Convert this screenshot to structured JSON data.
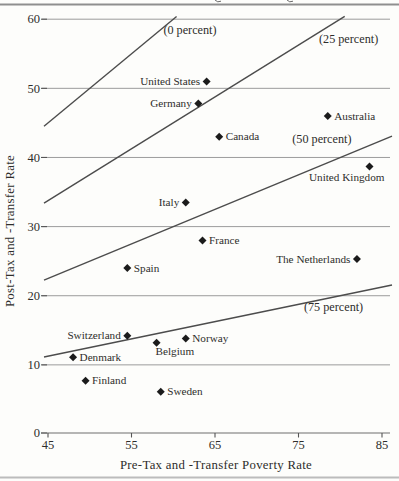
{
  "page": {
    "top_rule": {
      "visible": true,
      "descender_fragments_x": [
        218,
        290
      ]
    },
    "bottom_rule": {
      "visible": true
    }
  },
  "chart_data": {
    "type": "scatter",
    "title": "",
    "xlabel": "Pre-Tax and -Transfer Poverty Rate",
    "ylabel": "Post-Tax and -Transfer Rate",
    "xlim": [
      45,
      85
    ],
    "ylim": [
      0,
      60
    ],
    "x_ticks": [
      45,
      55,
      65,
      75,
      85
    ],
    "y_ticks": [
      0,
      10,
      20,
      30,
      40,
      50,
      60
    ],
    "grid": "horizontal-only",
    "marker": "diamond",
    "legend_position": "none",
    "points": [
      {
        "label": "United States",
        "x": 64,
        "y": 51,
        "label_side": "left"
      },
      {
        "label": "Germany",
        "x": 63,
        "y": 47.8,
        "label_side": "left"
      },
      {
        "label": "Australia",
        "x": 78.5,
        "y": 46,
        "label_side": "right"
      },
      {
        "label": "Canada",
        "x": 65.5,
        "y": 43,
        "label_side": "right"
      },
      {
        "label": "United Kingdom",
        "x": 83.5,
        "y": 38.7,
        "label_side": "below-left"
      },
      {
        "label": "Italy",
        "x": 61.5,
        "y": 33.5,
        "label_side": "left"
      },
      {
        "label": "France",
        "x": 63.5,
        "y": 28,
        "label_side": "right"
      },
      {
        "label": "The Netherlands",
        "x": 82,
        "y": 25.3,
        "label_side": "left"
      },
      {
        "label": "Spain",
        "x": 54.5,
        "y": 24,
        "label_side": "right"
      },
      {
        "label": "Switzerland",
        "x": 54.5,
        "y": 14.2,
        "label_side": "left"
      },
      {
        "label": "Norway",
        "x": 61.5,
        "y": 13.8,
        "label_side": "right"
      },
      {
        "label": "Belgium",
        "x": 58,
        "y": 13.2,
        "label_side": "below-right"
      },
      {
        "label": "Denmark",
        "x": 48,
        "y": 11.1,
        "label_side": "right"
      },
      {
        "label": "Finland",
        "x": 49.5,
        "y": 7.7,
        "label_side": "right"
      },
      {
        "label": "Sweden",
        "x": 58.5,
        "y": 6.1,
        "label_side": "right"
      }
    ],
    "reduction_lines": [
      {
        "label": "(0 percent)",
        "reduction_pct": 0,
        "label_x": 62,
        "label_y": 57.8
      },
      {
        "label": "(25 percent)",
        "reduction_pct": 25,
        "label_x": 81,
        "label_y": 56.6
      },
      {
        "label": "(50 percent)",
        "reduction_pct": 50,
        "label_x": 77.8,
        "label_y": 42.1
      },
      {
        "label": "(75 percent)",
        "reduction_pct": 75,
        "label_x": 79.2,
        "label_y": 17.8
      }
    ],
    "line_rule": "post_rate = pre_rate * (1 - reduction_pct/100)",
    "colors": {
      "marker": "#1b1b1b",
      "line": "#4c4c4c",
      "grid": "#9c9c9c",
      "axis": "#6e6e6e",
      "tick": "#555555",
      "text": "#2e2d2b",
      "rule_top": "#8f8f8f",
      "rule_bottom": "#bcbcbc",
      "background": "#fdfdfb"
    }
  }
}
